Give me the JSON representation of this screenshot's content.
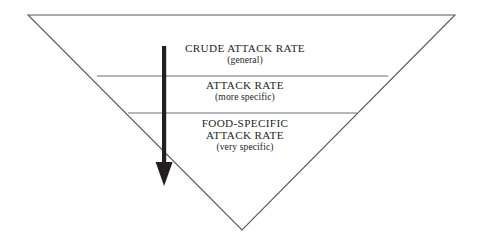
{
  "figure": {
    "background_color": "#ffffff",
    "outline_color": "#58595b",
    "divider_color": "#6d6e71",
    "arrow_color": "#231f20",
    "text_color": "#231f20",
    "triangle": {
      "top_left": [
        28,
        15
      ],
      "top_right": [
        455,
        15
      ],
      "apex": [
        242,
        230
      ]
    },
    "dividers": [
      {
        "y": 76,
        "x1": 97,
        "x2": 388
      },
      {
        "y": 113,
        "x1": 128,
        "x2": 357
      }
    ],
    "arrow": {
      "name": "downward-arrow",
      "x": 164,
      "y_start": 46,
      "y_tip": 186,
      "shaft_width": 4,
      "head_width": 17,
      "head_height": 24
    },
    "tiers": [
      {
        "id": "crude",
        "label": "CRUDE ATTACK RATE",
        "sublabel": "(general)"
      },
      {
        "id": "attack",
        "label": "ATTACK RATE",
        "sublabel": "(more specific)"
      },
      {
        "id": "food",
        "label": "FOOD-SPECIFIC",
        "label2": "ATTACK RATE",
        "sublabel": "(very specific)"
      }
    ]
  }
}
